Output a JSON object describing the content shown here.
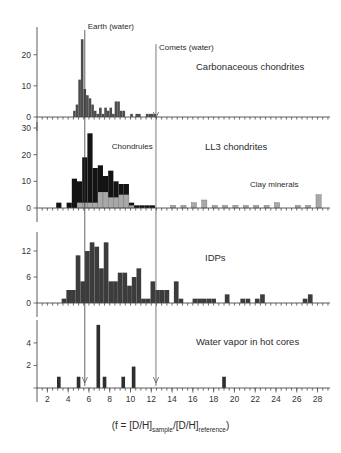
{
  "figure": {
    "xaxis_caption_main": "(f = [D/H]",
    "xaxis_caption_sub1": "sample",
    "xaxis_caption_mid": "/[D/H]",
    "xaxis_caption_sub2": "reference",
    "xaxis_caption_end": ")",
    "xaxis_ticks": [
      "2",
      "4",
      "6",
      "8",
      "10",
      "12",
      "14",
      "16",
      "18",
      "20",
      "22",
      "24",
      "26",
      "28"
    ],
    "xaxis_tick_values": [
      2,
      4,
      6,
      8,
      10,
      12,
      14,
      16,
      18,
      20,
      22,
      24,
      26,
      28
    ],
    "xmin": 1.0,
    "xmax": 29.2,
    "reference_lines": [
      {
        "name": "earth-water",
        "label": "Earth (water)",
        "value": 5.6,
        "color": "#3a3a3a",
        "has_arrow": false
      },
      {
        "name": "comets-water",
        "label": "Comets (water)",
        "value": 12.45,
        "color": "#5a5a5a",
        "has_arrow": false
      }
    ],
    "colors": {
      "bar_dark": "#4d4d4d",
      "bar_black": "#131313",
      "bar_gray": "#a8a8a8",
      "bar_idp": "#3c3c3c",
      "bar_water": "#2e2e2e",
      "axis": "#4a4a4a",
      "text": "#2b2b2b"
    }
  },
  "chart_data": [
    {
      "type": "bar",
      "panel": "carbonaceous-chondrites",
      "title": "Carbonaceous chondrites",
      "xlabel": "",
      "ylabel": "",
      "ylim": [
        0,
        27
      ],
      "yticks": [
        0,
        10,
        20
      ],
      "ytick_labels": [
        "0",
        "10",
        "20"
      ],
      "bin_width": 0.25,
      "x": [
        4.6,
        4.85,
        5.1,
        5.35,
        5.6,
        5.85,
        6.1,
        6.35,
        6.6,
        6.85,
        7.1,
        7.35,
        7.6,
        7.85,
        8.1,
        8.35,
        8.6,
        8.85,
        9.1,
        9.35,
        9.6,
        9.85,
        10.1,
        10.35,
        10.6,
        10.85,
        11.1,
        11.35,
        11.6,
        11.85,
        12.1,
        12.35,
        12.6
      ],
      "values": [
        2,
        4,
        12,
        25,
        9,
        7,
        6,
        4,
        2,
        1,
        3,
        1,
        3,
        2,
        3,
        1,
        5,
        5,
        2,
        2,
        0,
        0,
        1,
        0,
        1,
        1,
        0,
        0,
        1,
        1,
        1,
        1,
        0
      ],
      "notes": "Histogram with a sharp peak of 25 at f near Earth water value"
    },
    {
      "type": "bar",
      "panel": "ll3-chondrites",
      "title": "LL3 chondrites",
      "xlabel": "",
      "ylabel": "",
      "ylim": [
        0,
        30
      ],
      "yticks": [
        0,
        10,
        20,
        30
      ],
      "ytick_labels": [
        "0",
        "10",
        "20",
        "30"
      ],
      "bin_width": 0.5,
      "stacked": true,
      "series": [
        {
          "name": "Chondrules",
          "color": "#131313",
          "x": [
            3.1,
            3.6,
            4.1,
            4.6,
            5.1,
            5.6,
            6.1,
            6.6,
            7.1,
            7.6,
            8.1,
            8.6,
            9.1,
            9.6,
            10.1,
            10.6,
            11.1,
            11.6,
            12.1,
            12.6
          ],
          "values": [
            2,
            0,
            2,
            11,
            8,
            17,
            26,
            13,
            10,
            6,
            10,
            6,
            4,
            4,
            1,
            1,
            1,
            1,
            1,
            0
          ]
        },
        {
          "name": "Clay minerals",
          "color": "#a8a8a8",
          "x": [
            3.1,
            3.6,
            4.1,
            4.6,
            5.1,
            5.6,
            6.1,
            6.6,
            7.1,
            7.6,
            8.1,
            8.6,
            9.1,
            9.6,
            10.1,
            10.6,
            11.1,
            11.6,
            12.1,
            12.6,
            14.1,
            15.1,
            16.1,
            17.1,
            18.1,
            19.1,
            20.1,
            21.1,
            22.1,
            23.1,
            24.1,
            25.1,
            26.1,
            27.1,
            28.1
          ],
          "values": [
            0,
            0,
            0,
            0,
            2,
            2,
            2,
            2,
            6,
            6,
            4,
            4,
            5,
            5,
            1,
            0,
            0,
            0,
            0,
            0,
            1,
            1,
            2,
            3,
            1,
            1,
            1,
            1,
            1,
            1,
            2,
            0,
            1,
            1,
            5
          ]
        }
      ],
      "annotations": [
        {
          "label": "Chondrules",
          "x": 8.2,
          "y": 22
        },
        {
          "label": "Clay minerals",
          "x": 21.5,
          "y": 8
        }
      ]
    },
    {
      "type": "bar",
      "panel": "idps",
      "title": "IDPs",
      "xlabel": "",
      "ylabel": "",
      "ylim": [
        0,
        15
      ],
      "yticks": [
        0,
        6,
        12
      ],
      "ytick_labels": [
        "0",
        "6",
        "12"
      ],
      "bin_width": 0.45,
      "x": [
        3.6,
        4.05,
        4.5,
        4.95,
        5.4,
        5.85,
        6.3,
        6.75,
        7.2,
        7.65,
        8.1,
        8.55,
        9.0,
        9.45,
        9.9,
        10.35,
        10.8,
        11.25,
        11.7,
        12.15,
        12.6,
        13.05,
        13.5,
        13.95,
        14.4,
        14.85,
        16.2,
        16.65,
        17.1,
        17.55,
        18.0,
        19.3,
        20.8,
        21.3,
        22.2,
        22.7,
        26.8,
        27.3
      ],
      "values": [
        1,
        3,
        3,
        11,
        5,
        12,
        14,
        13,
        8,
        14,
        5,
        5,
        7,
        7,
        4,
        6,
        8,
        1,
        1,
        5,
        3,
        3,
        3,
        0,
        5,
        1,
        1,
        1,
        1,
        1,
        1,
        2,
        1,
        1,
        1,
        2,
        1,
        2
      ],
      "notes": "Broad distribution of interplanetary dust particles across full f range"
    },
    {
      "type": "bar",
      "panel": "water-vapor-hot-cores",
      "title": "Water vapor in hot cores",
      "xlabel": "",
      "ylabel": "",
      "ylim": [
        0,
        5.5
      ],
      "yticks": [
        0,
        2,
        4
      ],
      "ytick_labels": [
        "",
        "2",
        "4"
      ],
      "bin_width": 0.35,
      "x": [
        3.1,
        5.0,
        6.9,
        7.5,
        9.3,
        10.3,
        19.0
      ],
      "values": [
        1,
        1,
        5.6,
        1,
        1,
        1.9,
        1
      ],
      "notes": "Sparse bars; tall bar near f=7"
    }
  ]
}
